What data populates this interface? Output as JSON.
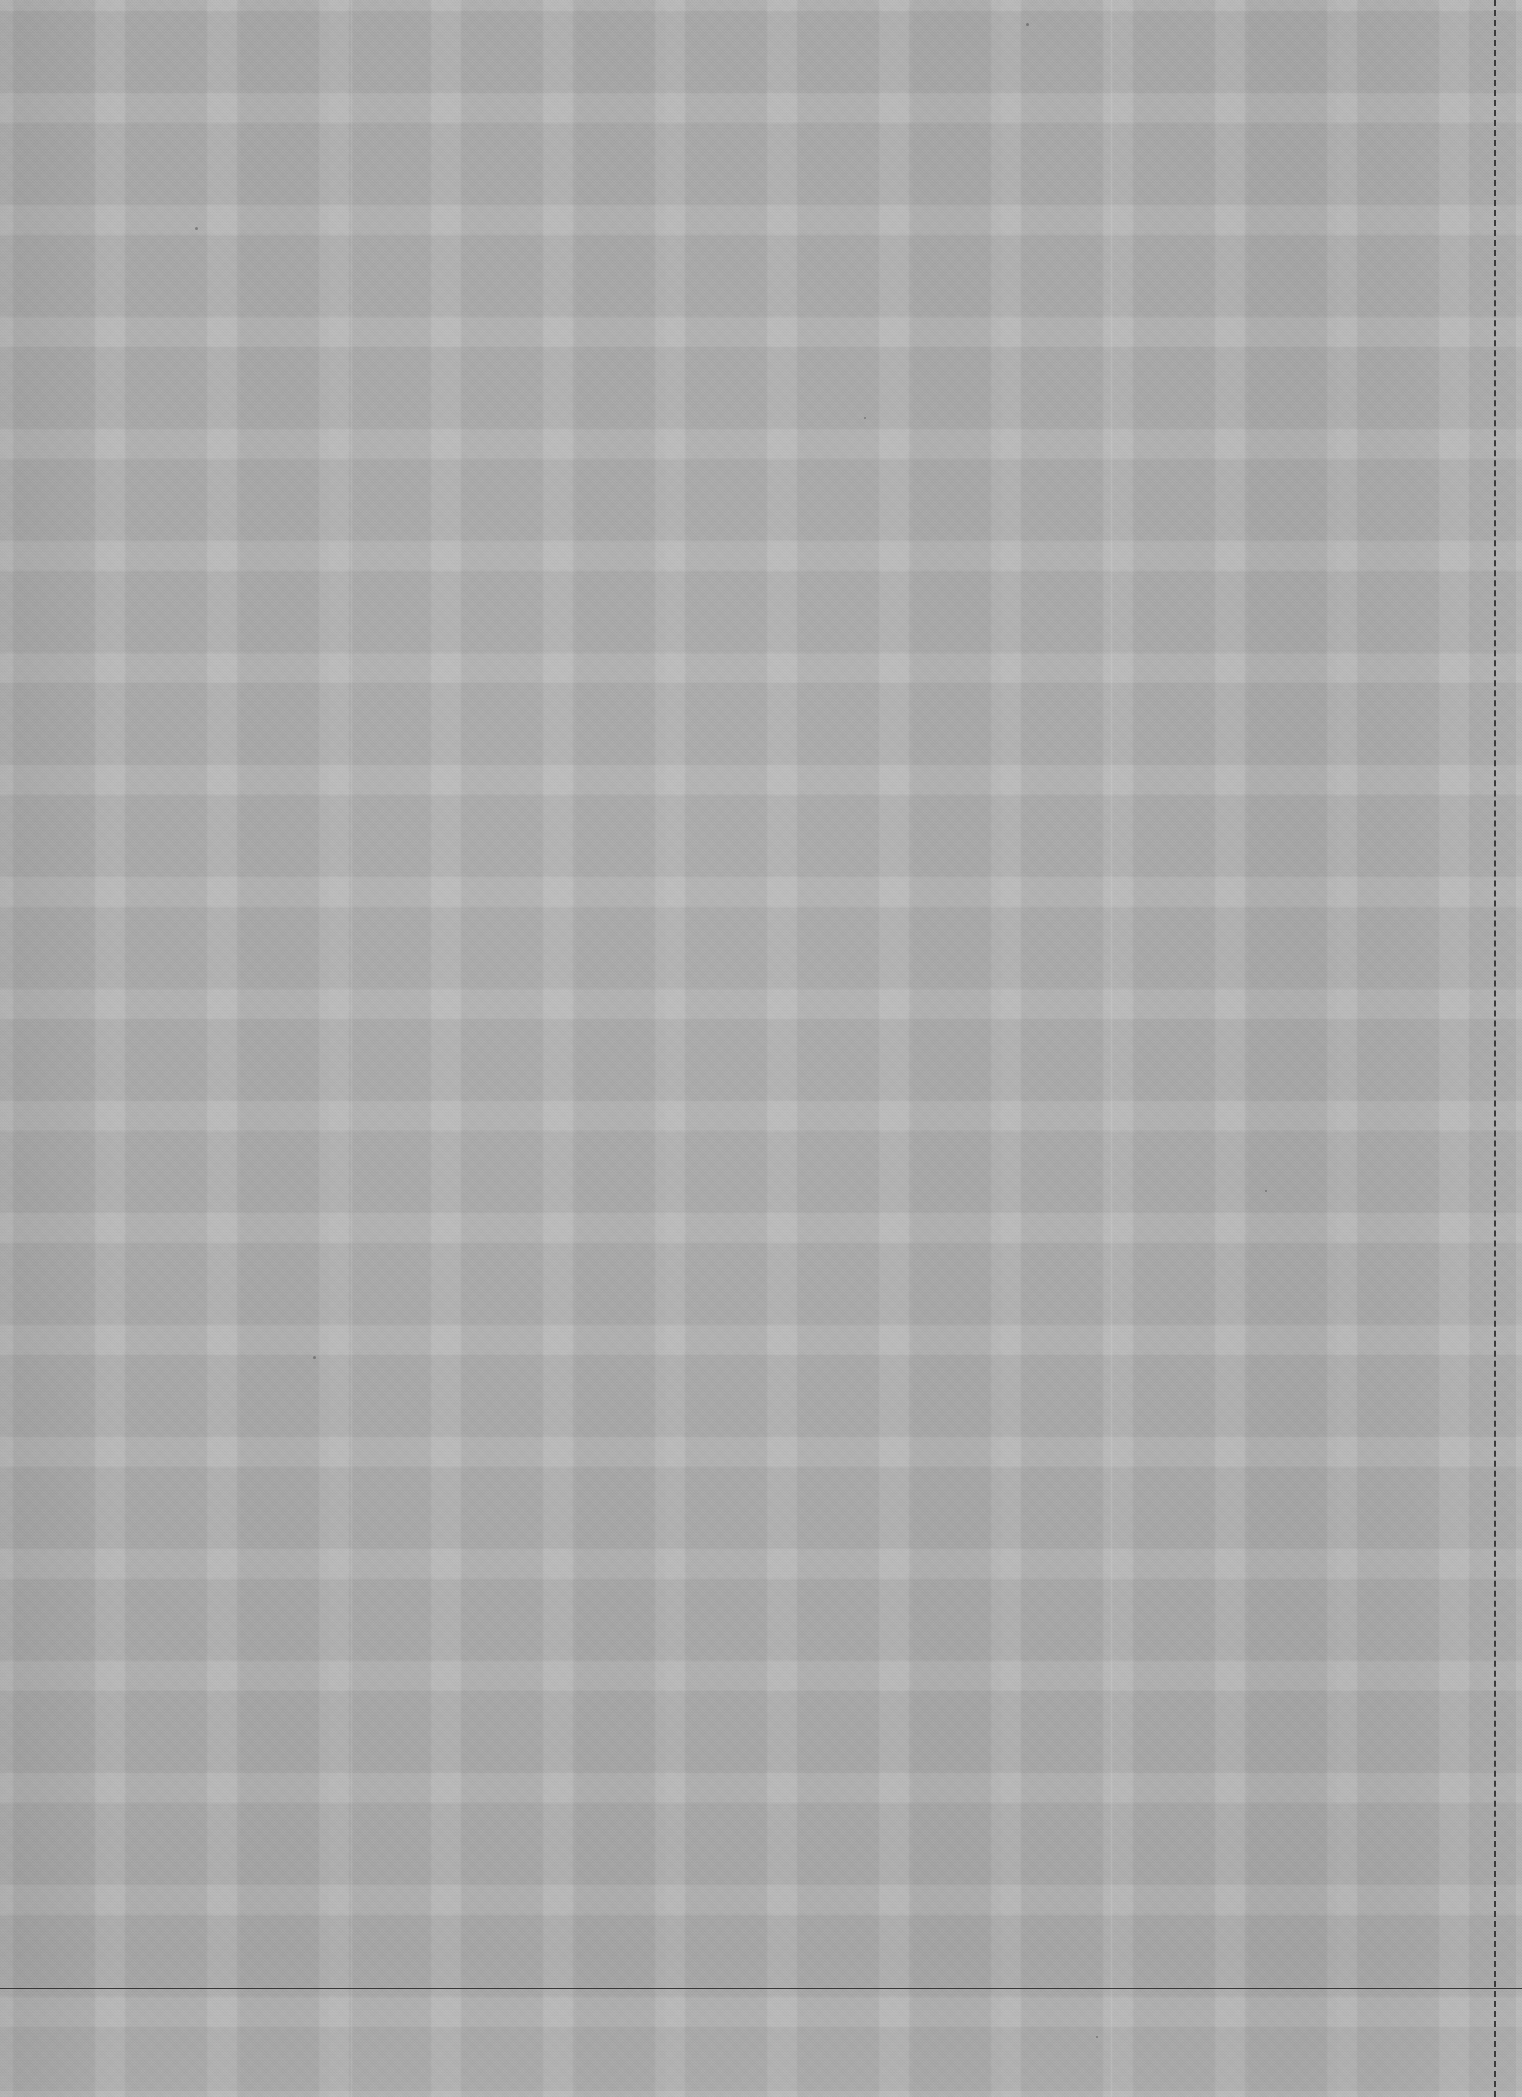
{
  "document": {
    "kind": "scanned-grid-paper",
    "description": "Grayscale scan of a blank sheet of grid (graph) paper",
    "width_px": 1522,
    "height_px": 2097,
    "visible_text": "",
    "colors": {
      "paper_base": "#b6b6b6",
      "cell_fill": "#a5a5a5",
      "gridline_gap": "#b9b9b9",
      "rule_ink": "#3c3c3c",
      "page_background": "#9a9a9a"
    }
  },
  "grid": {
    "cell_size_px": 112,
    "cell_inner_px": 82,
    "gutter_px": 20,
    "columns": 14,
    "rows": 19,
    "origin_x_px": -6,
    "origin_y_px": -6
  },
  "marks": {
    "dashed_margin_rule": {
      "orientation": "vertical",
      "x_px": 1494,
      "dash_pattern": "2px dashed",
      "color": "#3c3c3c"
    },
    "horizontal_rule": {
      "orientation": "horizontal",
      "y_px": 1988,
      "thickness_px": 1,
      "color": "#373737"
    },
    "creases": [
      {
        "x_px": 350
      },
      {
        "x_px": 1110
      }
    ],
    "specks": [
      {
        "x_px": 195,
        "y_px": 227,
        "size_px": 3
      },
      {
        "x_px": 1026,
        "y_px": 23,
        "size_px": 3
      },
      {
        "x_px": 313,
        "y_px": 1356,
        "size_px": 3
      },
      {
        "x_px": 1265,
        "y_px": 1190,
        "size_px": 2
      },
      {
        "x_px": 1096,
        "y_px": 2036,
        "size_px": 2
      },
      {
        "x_px": 864,
        "y_px": 417,
        "size_px": 2
      }
    ]
  }
}
